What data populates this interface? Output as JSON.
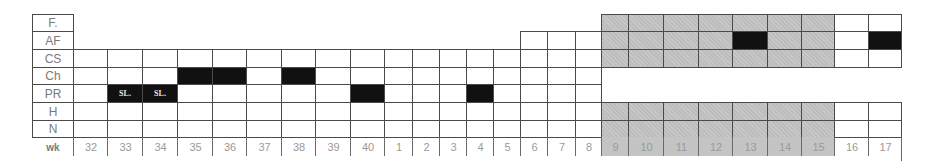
{
  "chart_data": {
    "type": "table",
    "title": "",
    "row_labels": [
      "F.",
      "AF",
      "CS",
      "Ch",
      "PR",
      "H",
      "N"
    ],
    "x_label": "wk",
    "weeks": [
      "32",
      "33",
      "34",
      "35",
      "36",
      "37",
      "38",
      "39",
      "40",
      "1",
      "2",
      "3",
      "4",
      "5",
      "6",
      "7",
      "8",
      "9",
      "10",
      "11",
      "12",
      "13",
      "14",
      "15",
      "16",
      "17"
    ],
    "legend": {
      "white": "empty",
      "gray": "shaded period (weeks 9–15)",
      "black": "occupied / scheduled"
    },
    "colors": {
      "grid": "#4a4a4a",
      "gray": "#bdbdbd",
      "black": "#111111",
      "label_text": "#7a7a7a"
    },
    "rows_present_from_week": {
      "F.": "9",
      "AF": "6",
      "CS": "32",
      "Ch": "32",
      "PR": "32",
      "H": "32",
      "N": "32"
    },
    "rows_absent_weeks": {
      "Ch": [
        "9",
        "10",
        "11",
        "12",
        "13",
        "14",
        "15",
        "16",
        "17"
      ],
      "PR": [
        "9",
        "10",
        "11",
        "12",
        "13",
        "14",
        "15",
        "16",
        "17"
      ]
    },
    "gray_weeks": [
      "9",
      "10",
      "11",
      "12",
      "13",
      "14",
      "15"
    ],
    "black_cells": [
      {
        "row": "Ch",
        "week": "35"
      },
      {
        "row": "Ch",
        "week": "36"
      },
      {
        "row": "Ch",
        "week": "38"
      },
      {
        "row": "PR",
        "week": "33",
        "text": "SL."
      },
      {
        "row": "PR",
        "week": "34",
        "text": "SL."
      },
      {
        "row": "PR",
        "week": "40"
      },
      {
        "row": "PR",
        "week": "4"
      },
      {
        "row": "AF",
        "week": "13"
      },
      {
        "row": "AF",
        "week": "17"
      }
    ]
  },
  "layout": {
    "label_col": [
      32,
      73
    ],
    "col_edges": [
      73,
      107,
      142,
      177,
      212,
      246,
      281,
      315,
      350,
      384,
      412,
      439,
      466,
      493,
      520,
      547,
      575,
      601,
      628,
      663,
      698,
      732,
      767,
      801,
      834,
      868,
      901
    ],
    "row_edges": [
      14,
      31,
      49,
      67,
      84,
      102,
      120,
      137,
      155
    ]
  }
}
